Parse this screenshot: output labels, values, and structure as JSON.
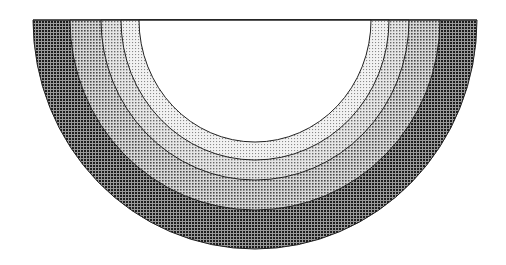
{
  "diagram": {
    "type": "concentric-semicircle-layers",
    "center": {
      "x": 255,
      "y": 20
    },
    "layers": [
      {
        "name": "outer-layer",
        "rx": 222,
        "ry": 229,
        "fill": "#3a3a3a",
        "pattern_density": "dark"
      },
      {
        "name": "layer-4",
        "rx": 185,
        "ry": 190,
        "fill": "#8c8c8c",
        "pattern_density": "medium-dark"
      },
      {
        "name": "layer-3",
        "rx": 154,
        "ry": 160,
        "fill": "#a8a8a8",
        "pattern_density": "medium"
      },
      {
        "name": "layer-2",
        "rx": 134,
        "ry": 140,
        "fill": "#cfcfcf",
        "pattern_density": "light"
      },
      {
        "name": "inner-core",
        "rx": 116,
        "ry": 122,
        "fill": "#ffffff",
        "pattern_density": "none"
      }
    ],
    "stroke": "#222222"
  }
}
